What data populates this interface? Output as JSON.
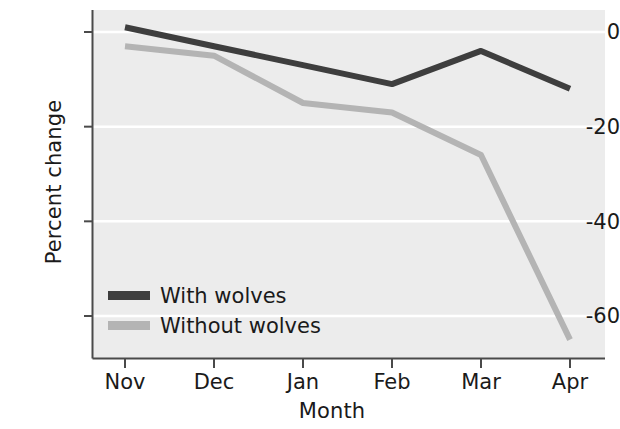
{
  "chart_data": {
    "type": "line",
    "title": "",
    "xlabel": "Month",
    "ylabel": "Percent change",
    "categories": [
      "Nov",
      "Dec",
      "Jan",
      "Feb",
      "Mar",
      "Apr"
    ],
    "series": [
      {
        "name": "With wolves",
        "color": "#3e3e3e",
        "values": [
          1,
          -3,
          -7,
          -11,
          -4,
          -12
        ]
      },
      {
        "name": "Without wolves",
        "color": "#b4b4b4",
        "values": [
          -3,
          -5,
          -15,
          -17,
          -26,
          -65
        ]
      }
    ],
    "ylim": [
      -70,
      3
    ],
    "yticks": [
      0,
      -20,
      -40,
      -60
    ],
    "ytick_labels": [
      "0",
      "-20",
      "-40",
      "-60"
    ],
    "xtick_labels": [
      "Nov",
      "Dec",
      "Jan",
      "Feb",
      "Mar",
      "Apr"
    ],
    "grid": true,
    "grid_color": "#ffffff",
    "plot_background": "#ececec",
    "legend_position": "lower left",
    "legend_entries": [
      "With wolves",
      "Without wolves"
    ]
  },
  "axes": {
    "y_title": "Percent change",
    "x_title": "Month",
    "y_ticks": [
      {
        "label": "0"
      },
      {
        "label": "-20"
      },
      {
        "label": "-40"
      },
      {
        "label": "-60"
      }
    ],
    "x_ticks": [
      {
        "label": "Nov"
      },
      {
        "label": "Dec"
      },
      {
        "label": "Jan"
      },
      {
        "label": "Feb"
      },
      {
        "label": "Mar"
      },
      {
        "label": "Apr"
      }
    ]
  },
  "legend": {
    "entries": [
      {
        "label": "With wolves",
        "color": "#3e3e3e"
      },
      {
        "label": "Without wolves",
        "color": "#b4b4b4"
      }
    ]
  }
}
